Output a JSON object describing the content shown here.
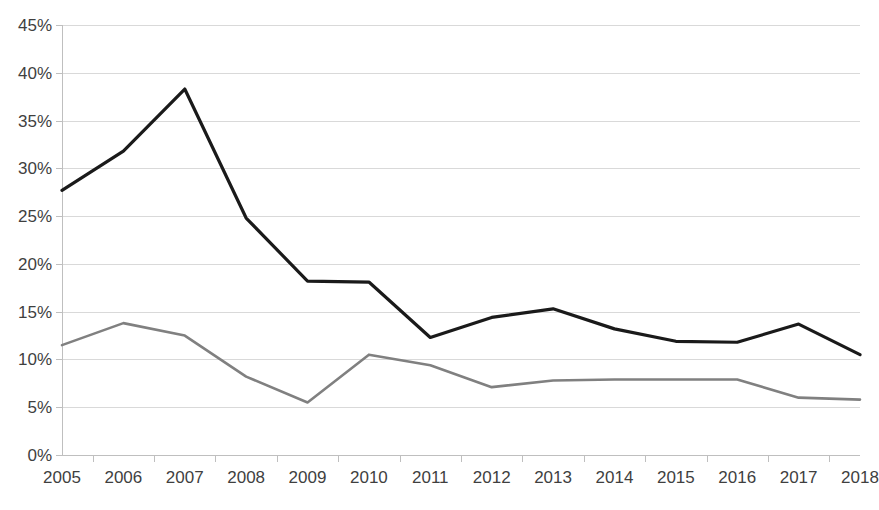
{
  "chart_data": {
    "type": "line",
    "title": "",
    "subtitle": "",
    "xlabel": "",
    "ylabel": "",
    "grid": true,
    "legend_position": "none",
    "ylim": [
      0,
      45
    ],
    "ytick_labels": [
      "0%",
      "5%",
      "10%",
      "15%",
      "20%",
      "25%",
      "30%",
      "35%",
      "40%",
      "45%"
    ],
    "ytick_values": [
      0,
      5,
      10,
      15,
      20,
      25,
      30,
      35,
      40,
      45
    ],
    "categories": [
      "2005",
      "2006",
      "2007",
      "2008",
      "2009",
      "2010",
      "2011",
      "2012",
      "2013",
      "2014",
      "2015",
      "2016",
      "2017",
      "2018"
    ],
    "x": [
      2005,
      2006,
      2007,
      2008,
      2009,
      2010,
      2011,
      2012,
      2013,
      2014,
      2015,
      2016,
      2017,
      2018
    ],
    "series": [
      {
        "name": "series-dark",
        "color": "#1a1a1a",
        "line_width": 3.2,
        "values": [
          27.7,
          31.8,
          38.3,
          24.8,
          18.2,
          18.1,
          12.3,
          14.4,
          15.3,
          13.2,
          11.9,
          11.8,
          13.7,
          10.5
        ]
      },
      {
        "name": "series-gray",
        "color": "#808080",
        "line_width": 2.6,
        "values": [
          11.5,
          13.8,
          12.5,
          8.2,
          5.5,
          10.5,
          9.4,
          7.1,
          7.8,
          7.9,
          7.9,
          7.9,
          6.0,
          5.8
        ]
      }
    ]
  },
  "axes": {
    "plot_left": 62,
    "plot_right": 860,
    "plot_top": 25,
    "plot_bottom": 455
  }
}
